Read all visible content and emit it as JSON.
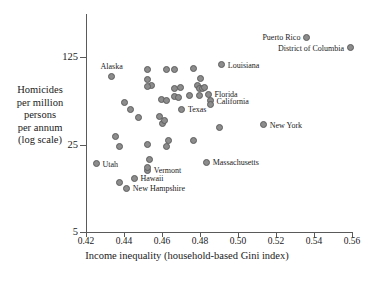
{
  "chart_data": {
    "type": "scatter",
    "title": "",
    "xlabel": "Income inequality (household-based Gini index)",
    "ylabel": "Homicides per million persons per annum (log scale)",
    "ylabel_lines": [
      "Homicides",
      "per million",
      "persons",
      "per annum",
      "(log scale)"
    ],
    "xlim": [
      0.42,
      0.56
    ],
    "ylim": [
      5,
      190
    ],
    "yscale": "log",
    "grid": false,
    "legend": "none",
    "xticks": [
      "0.42",
      "0.44",
      "0.46",
      "0.48",
      "0.50",
      "0.52",
      "0.54",
      "0.56"
    ],
    "xtick_values": [
      0.42,
      0.44,
      0.46,
      0.48,
      0.5,
      0.52,
      0.54,
      0.56
    ],
    "yticks": [
      "125",
      "25",
      "5"
    ],
    "ytick_values": [
      125,
      25,
      5
    ],
    "marker_color": "#8c8c8c",
    "marker_edge_color": "#5e5e5e",
    "points": [
      {
        "label": "Puerto Rico",
        "x": 0.536,
        "y": 180,
        "label_pos": "left"
      },
      {
        "label": "District of Columbia",
        "x": 0.559,
        "y": 148,
        "label_pos": "left"
      },
      {
        "label": "Louisiana",
        "x": 0.4915,
        "y": 108,
        "label_pos": "right"
      },
      {
        "label": "Alaska",
        "x": 0.4335,
        "y": 88,
        "label_pos": "above"
      },
      {
        "label": "Florida",
        "x": 0.4845,
        "y": 63,
        "label_pos": "right"
      },
      {
        "label": "California",
        "x": 0.4855,
        "y": 56,
        "label_pos": "right"
      },
      {
        "label": "Texas",
        "x": 0.4705,
        "y": 48,
        "label_pos": "right"
      },
      {
        "label": "New York",
        "x": 0.5135,
        "y": 36,
        "label_pos": "right"
      },
      {
        "label": "Massachusetts",
        "x": 0.4835,
        "y": 18,
        "label_pos": "right"
      },
      {
        "label": "Utah",
        "x": 0.4255,
        "y": 17.5,
        "label_pos": "right"
      },
      {
        "label": "Vermont",
        "x": 0.4525,
        "y": 15.5,
        "label_pos": "right"
      },
      {
        "label": "Hawaii",
        "x": 0.4455,
        "y": 13.5,
        "label_pos": "right"
      },
      {
        "label": "New Hampshire",
        "x": 0.4415,
        "y": 11.2,
        "label_pos": "right"
      },
      {
        "label": "",
        "x": 0.4525,
        "y": 100
      },
      {
        "label": "",
        "x": 0.4625,
        "y": 100
      },
      {
        "label": "",
        "x": 0.4665,
        "y": 100
      },
      {
        "label": "",
        "x": 0.4765,
        "y": 101
      },
      {
        "label": "",
        "x": 0.4525,
        "y": 82
      },
      {
        "label": "",
        "x": 0.4545,
        "y": 74
      },
      {
        "label": "",
        "x": 0.4525,
        "y": 73
      },
      {
        "label": "",
        "x": 0.4805,
        "y": 84
      },
      {
        "label": "",
        "x": 0.4665,
        "y": 70
      },
      {
        "label": "",
        "x": 0.4695,
        "y": 71
      },
      {
        "label": "",
        "x": 0.4785,
        "y": 74
      },
      {
        "label": "",
        "x": 0.4795,
        "y": 70
      },
      {
        "label": "",
        "x": 0.4815,
        "y": 70
      },
      {
        "label": "",
        "x": 0.4825,
        "y": 71
      },
      {
        "label": "",
        "x": 0.4405,
        "y": 54
      },
      {
        "label": "",
        "x": 0.4435,
        "y": 48
      },
      {
        "label": "",
        "x": 0.4595,
        "y": 57
      },
      {
        "label": "",
        "x": 0.4625,
        "y": 56
      },
      {
        "label": "",
        "x": 0.4665,
        "y": 60
      },
      {
        "label": "",
        "x": 0.4685,
        "y": 59
      },
      {
        "label": "",
        "x": 0.4745,
        "y": 62
      },
      {
        "label": "",
        "x": 0.4795,
        "y": 62
      },
      {
        "label": "",
        "x": 0.4855,
        "y": 52
      },
      {
        "label": "",
        "x": 0.4475,
        "y": 41
      },
      {
        "label": "",
        "x": 0.4585,
        "y": 42
      },
      {
        "label": "",
        "x": 0.4605,
        "y": 37
      },
      {
        "label": "",
        "x": 0.4615,
        "y": 39
      },
      {
        "label": "",
        "x": 0.4355,
        "y": 29
      },
      {
        "label": "",
        "x": 0.4635,
        "y": 27
      },
      {
        "label": "",
        "x": 0.4765,
        "y": 27
      },
      {
        "label": "",
        "x": 0.4905,
        "y": 34
      },
      {
        "label": "",
        "x": 0.4375,
        "y": 24
      },
      {
        "label": "",
        "x": 0.4525,
        "y": 25
      },
      {
        "label": "",
        "x": 0.4625,
        "y": 24
      },
      {
        "label": "",
        "x": 0.4535,
        "y": 19
      },
      {
        "label": "",
        "x": 0.4525,
        "y": 16.3
      },
      {
        "label": "",
        "x": 0.4375,
        "y": 12.5
      }
    ]
  }
}
